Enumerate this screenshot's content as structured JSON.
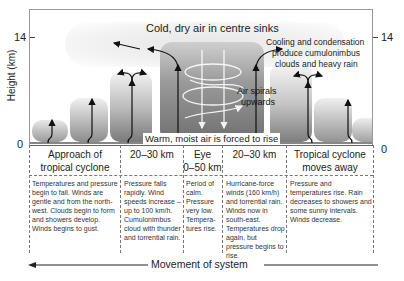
{
  "diagram": {
    "y_axis": {
      "label": "Height (km)",
      "ticks": [
        "14",
        "0"
      ]
    },
    "annotations": {
      "top": "Cold, dry air in centre sinks",
      "right_line1": "Cooling and condensation",
      "right_line2": "produce cumulonimbus",
      "right_line3": "clouds and heavy rain",
      "spiral_line1": "Air spirals",
      "spiral_line2": "upwards",
      "bottom": "Warm, moist air is forced to rise"
    },
    "columns": [
      {
        "header_line1": "Approach of",
        "header_line2": "tropical cyclone",
        "body": "Temperatures and pressure begin to fall. Winds are gentle and from the north-west. Clouds begin to form and showers develop. Winds begins to gust."
      },
      {
        "header_line1": "20–30 km",
        "header_line2": "",
        "body": "Pressure falls rapidly. Wind speeds increase – up to 100 km/h. Cumulonimbus cloud with thunder and torrential rain."
      },
      {
        "header_line1": "Eye",
        "header_line2": "0–50 km",
        "body": "Period of calm. Pressure very low. Tempera-tures rise."
      },
      {
        "header_line1": "20–30 km",
        "header_line2": "",
        "body": "Hurricane-force winds (160 km/h) and torrential rain. Winds now in south-east. Temperatures drop again, but pressure begins to rise."
      },
      {
        "header_line1": "Tropical cyclone",
        "header_line2": "moves away",
        "body": "Pressure and temperatures rise. Rain decreases to showers and some sunny intervals. Winds decrease."
      }
    ],
    "movement_label": "Movement of system"
  }
}
